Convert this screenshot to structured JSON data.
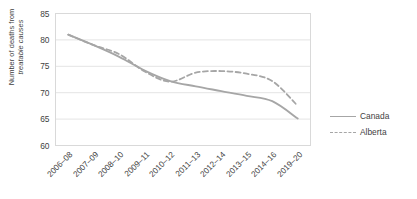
{
  "chart_data": {
    "type": "line",
    "title": "",
    "xlabel": "",
    "ylabel": "Number of deaths from treatable causes",
    "ylabel_plain": "Number of deaths from",
    "ylabel_italic": "treatable causes",
    "categories": [
      "2006–08",
      "2007–09",
      "2008–10",
      "2009–11",
      "2010–12",
      "2011–13",
      "2012–14",
      "2013–15",
      "2014–16",
      "2019–20"
    ],
    "yticks": [
      60,
      65,
      70,
      75,
      80,
      85
    ],
    "ylim": [
      60,
      85
    ],
    "grid": true,
    "legend_position": "right",
    "series": [
      {
        "name": "Canada",
        "style": "solid",
        "color": "#a6a6a6",
        "values": [
          81.0,
          79.0,
          76.8,
          74.2,
          72.2,
          71.2,
          70.3,
          69.4,
          68.4,
          65.1
        ]
      },
      {
        "name": "Alberta",
        "style": "dashed",
        "color": "#a6a6a6",
        "values": [
          81.0,
          79.0,
          77.3,
          74.0,
          72.1,
          73.8,
          74.1,
          73.6,
          72.2,
          67.5
        ]
      }
    ]
  },
  "legend": {
    "items": [
      {
        "label": "Canada",
        "style": "solid"
      },
      {
        "label": "Alberta",
        "style": "dashed"
      }
    ]
  }
}
